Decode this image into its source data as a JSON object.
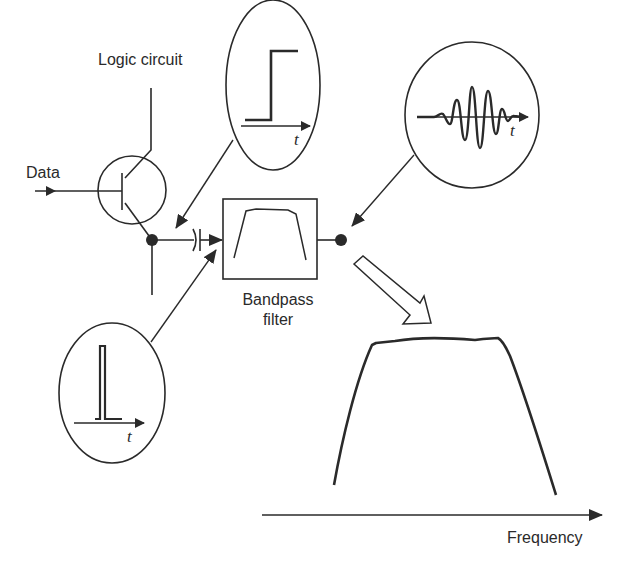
{
  "labels": {
    "logic_circuit": "Logic circuit",
    "data": "Data",
    "bandpass_line1": "Bandpass",
    "bandpass_line2": "filter",
    "frequency": "Frequency",
    "time_symbol": "t"
  },
  "insets": [
    {
      "id": "step",
      "description": "Step function vs time"
    },
    {
      "id": "wavelet",
      "description": "Oscillating pulse (wavelet) vs time"
    },
    {
      "id": "impulse",
      "description": "Narrow impulse vs time"
    }
  ],
  "spectrum": {
    "description": "Bandpass frequency response (flat-top passband)",
    "xlabel": "Frequency"
  },
  "colors": {
    "stroke": "#2a2a2a",
    "background": "#ffffff"
  }
}
